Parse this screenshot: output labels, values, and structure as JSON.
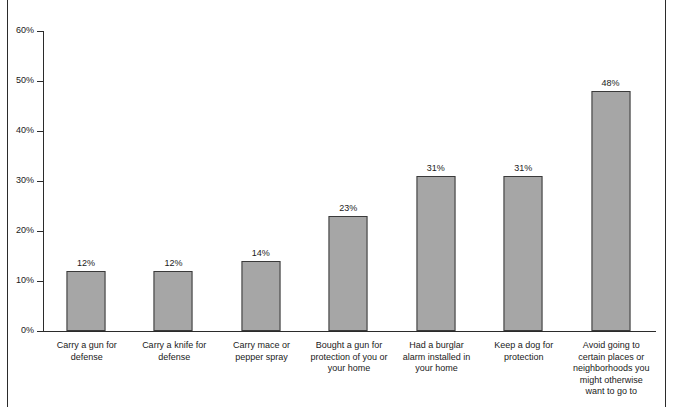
{
  "chart_data": {
    "type": "bar",
    "title": "",
    "xlabel": "",
    "ylabel": "",
    "ylim": [
      0,
      60
    ],
    "y_unit": "%",
    "grid": false,
    "legend": "none",
    "bar_color": "#a6a6a6",
    "bar_border_color": "#3a3a3a",
    "axis_color": "#2b2b2b",
    "frame_color": "#2b2b2b",
    "y_ticks": [
      "0%",
      "10%",
      "20%",
      "30%",
      "40%",
      "50%",
      "60%"
    ],
    "y_tick_values": [
      0,
      10,
      20,
      30,
      40,
      50,
      60
    ],
    "categories": [
      "Carry a gun for defense",
      "Carry a knife for defense",
      "Carry mace or pepper spray",
      "Bought a gun for protection of you or your home",
      "Had a burglar alarm installed in your home",
      "Keep a dog for protection",
      "Avoid going to certain places or neighborhoods you might otherwise want to go to"
    ],
    "category_lines": [
      [
        "Carry a gun for",
        "defense"
      ],
      [
        "Carry a knife for",
        "defense"
      ],
      [
        "Carry mace or",
        "pepper spray"
      ],
      [
        "Bought a gun for",
        "protection of you or",
        "your home"
      ],
      [
        "Had a burglar",
        "alarm installed in",
        "your home"
      ],
      [
        "Keep a dog for",
        "protection"
      ],
      [
        "Avoid going to",
        "certain places or",
        "neighborhoods you",
        "might otherwise",
        "want to go to"
      ]
    ],
    "values": [
      12,
      12,
      14,
      23,
      31,
      31,
      48
    ],
    "value_labels": [
      "12%",
      "12%",
      "14%",
      "23%",
      "31%",
      "31%",
      "48%"
    ]
  }
}
